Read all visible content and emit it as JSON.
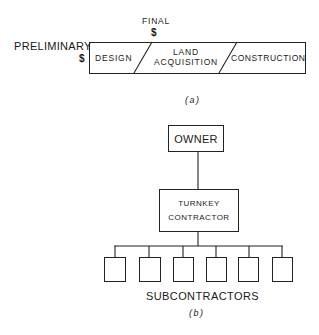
{
  "figure_a": {
    "caption": "(a)",
    "preliminary_label": "PRELIMINARY",
    "preliminary_marker": "$",
    "final_label": "FINAL",
    "final_marker": "$",
    "phases": [
      {
        "label_line1": "DESIGN",
        "label_line2": ""
      },
      {
        "label_line1": "LAND",
        "label_line2": "ACQUISITION"
      },
      {
        "label_line1": "CONSTRUCTION",
        "label_line2": ""
      }
    ]
  },
  "figure_b": {
    "caption": "(b)",
    "owner_label": "OWNER",
    "turnkey_line1": "TURNKEY",
    "turnkey_line2": "CONTRACTOR",
    "subcontractors_label": "SUBCONTRACTORS",
    "subcontractor_count": 6
  }
}
